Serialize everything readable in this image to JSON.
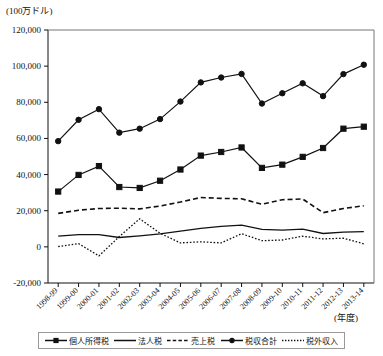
{
  "chart_data": {
    "type": "line",
    "title": "",
    "unit_label": "(100万ドル)",
    "xlabel": "(年度)",
    "ylabel": "",
    "ylim": [
      -20000,
      120000
    ],
    "yticks": [
      "120,000",
      "100,000",
      "80,000",
      "60,000",
      "40,000",
      "20,000",
      "0",
      "-20,000"
    ],
    "ytick_values": [
      120000,
      100000,
      80000,
      60000,
      40000,
      20000,
      0,
      -20000
    ],
    "grid": false,
    "legend_position": "bottom",
    "categories": [
      "1998-99",
      "1999-00",
      "2000-01",
      "2001-02",
      "2002-03",
      "2003-04",
      "2004-05",
      "2005-06",
      "2006-07",
      "2007-08",
      "2008-09",
      "2009-10",
      "2010-11",
      "2011-12",
      "2012-13",
      "2013-14"
    ],
    "series": [
      {
        "name": "税収合計",
        "marker": "circle",
        "style": "solid",
        "values": [
          58500,
          70300,
          76200,
          63200,
          65400,
          70700,
          80400,
          91000,
          93700,
          95700,
          79300,
          85000,
          90500,
          83400,
          95600,
          100800
        ]
      },
      {
        "name": "個人所得税",
        "marker": "square",
        "style": "solid",
        "values": [
          30600,
          39800,
          44700,
          33100,
          32600,
          36600,
          42800,
          50500,
          52500,
          55000,
          43700,
          45500,
          49800,
          54700,
          65400,
          66500
        ]
      },
      {
        "name": "売上税",
        "marker": "none",
        "style": "dashed",
        "values": [
          18500,
          20300,
          21200,
          21400,
          21000,
          22600,
          24800,
          27300,
          26800,
          26600,
          23600,
          26100,
          26500,
          18900,
          21200,
          22700
        ]
      },
      {
        "name": "法人税",
        "marker": "none",
        "style": "solid",
        "values": [
          5900,
          6700,
          6700,
          5200,
          6100,
          7200,
          8700,
          10200,
          11300,
          12000,
          9700,
          9300,
          9800,
          7400,
          8100,
          8400
        ]
      },
      {
        "name": "税外収入",
        "marker": "none",
        "style": "dotted",
        "values": [
          200,
          1800,
          -5000,
          5700,
          15500,
          7500,
          2200,
          2800,
          2200,
          7300,
          3400,
          3800,
          5900,
          4400,
          4800,
          1700
        ]
      }
    ]
  },
  "legend": {
    "items": [
      {
        "label": "個人所得税",
        "style": "solid-square"
      },
      {
        "label": "法人税",
        "style": "solid"
      },
      {
        "label": "売上税",
        "style": "dashed"
      },
      {
        "label": "税収合計",
        "style": "solid-circle"
      },
      {
        "label": "税外収入",
        "style": "dotted"
      }
    ]
  }
}
